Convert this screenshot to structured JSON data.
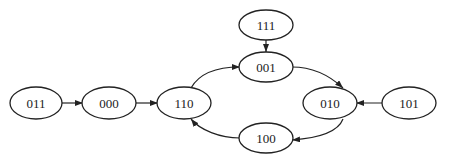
{
  "diagram": {
    "type": "state-transition-graph",
    "nodes": [
      {
        "id": "011",
        "label": "011",
        "cx": 36,
        "cy": 103
      },
      {
        "id": "000",
        "label": "000",
        "cx": 109,
        "cy": 103
      },
      {
        "id": "110",
        "label": "110",
        "cx": 184,
        "cy": 103
      },
      {
        "id": "111",
        "label": "111",
        "cx": 266,
        "cy": 25
      },
      {
        "id": "001",
        "label": "001",
        "cx": 266,
        "cy": 67
      },
      {
        "id": "010",
        "label": "010",
        "cx": 330,
        "cy": 103
      },
      {
        "id": "101",
        "label": "101",
        "cx": 409,
        "cy": 103
      },
      {
        "id": "100",
        "label": "100",
        "cx": 266,
        "cy": 138
      }
    ],
    "edges": [
      {
        "from": "011",
        "to": "000"
      },
      {
        "from": "000",
        "to": "110"
      },
      {
        "from": "110",
        "to": "001"
      },
      {
        "from": "111",
        "to": "001"
      },
      {
        "from": "001",
        "to": "010"
      },
      {
        "from": "101",
        "to": "010"
      },
      {
        "from": "010",
        "to": "100"
      },
      {
        "from": "100",
        "to": "110"
      }
    ]
  }
}
